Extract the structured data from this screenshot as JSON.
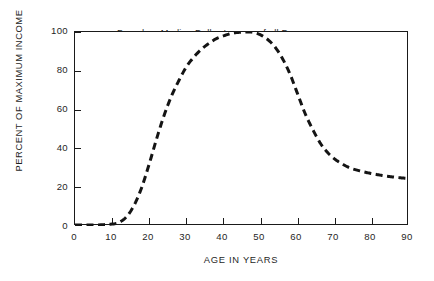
{
  "chart_data": {
    "type": "line",
    "title": "Based on Median Dollar Income of all Persons in the United States",
    "title_lines": [
      "Based on Median Dollar Income of all Persons",
      "in the United States"
    ],
    "xlabel": "AGE IN YEARS",
    "ylabel": "PERCENT OF MAXIMUM INCOME",
    "xlim": [
      0,
      90
    ],
    "ylim": [
      0,
      100
    ],
    "xticks": [
      0,
      10,
      20,
      30,
      40,
      50,
      60,
      70,
      80,
      90
    ],
    "yticks": [
      0,
      20,
      40,
      60,
      80,
      100
    ],
    "xtick_labels": [
      "0",
      "10",
      "20",
      "30",
      "40",
      "50",
      "60",
      "70",
      "80",
      "90"
    ],
    "ytick_labels": [
      "0",
      "20",
      "40",
      "60",
      "80",
      "100"
    ],
    "grid": false,
    "legend": null,
    "line_style": "dashed",
    "line_color": "#141414",
    "line_width": 3,
    "x": [
      0,
      5,
      10,
      12,
      14,
      16,
      18,
      20,
      22,
      24,
      26,
      28,
      30,
      32,
      34,
      36,
      38,
      40,
      42,
      44,
      46,
      48,
      50,
      52,
      54,
      56,
      58,
      60,
      62,
      64,
      66,
      68,
      70,
      72,
      74,
      76,
      78,
      80,
      82,
      84,
      86,
      88,
      90
    ],
    "y": [
      0.5,
      0.5,
      1,
      2,
      5,
      11,
      20,
      32,
      45,
      57,
      67,
      75,
      82,
      87,
      91,
      94,
      96.5,
      98,
      99.2,
      99.8,
      100,
      99.8,
      98.5,
      96,
      92,
      86,
      78,
      68,
      58,
      50,
      43,
      38,
      34.5,
      32,
      30,
      28.8,
      27.8,
      27,
      26.3,
      25.7,
      25.2,
      24.8,
      24.5
    ]
  }
}
